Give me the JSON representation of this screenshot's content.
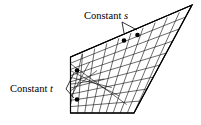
{
  "figure": {
    "type": "geometric-diagram",
    "background_color": "#ffffff",
    "line_color": "#000000",
    "grid_color": "#1a1a1a",
    "labels": [
      {
        "id": "constant-s",
        "prefix": "Constant",
        "symbol": "s",
        "text_x": 84,
        "text_y": 19,
        "leader": "M 122 22 L 124 33 M 122 22 L 137 30",
        "dots": [
          {
            "cx": 124.0,
            "cy": 40.5,
            "r": 2.3
          },
          {
            "cx": 137.5,
            "cy": 35.0,
            "r": 2.3
          }
        ]
      },
      {
        "id": "constant-t",
        "prefix": "Constant",
        "symbol": "t",
        "text_x": 10,
        "text_y": 92,
        "leader": "M 66 89 L 74 73 M 66 89 L 74 98",
        "dots": [
          {
            "cx": 77.0,
            "cy": 70.5,
            "r": 2.3
          },
          {
            "cx": 77.0,
            "cy": 99.5,
            "r": 2.3
          }
        ]
      }
    ],
    "patch": {
      "corners": {
        "top_left": [
          70.5,
          57.0
        ],
        "top_right": [
          192.0,
          5.0
        ],
        "bottom_right": [
          134.0,
          113.0
        ],
        "bottom_left": [
          70.5,
          113.0
        ]
      },
      "outline_path": "M 70.5 57 L 192 5 L 134 113 L 70.5 113 Z",
      "grid_u_divisions": 9,
      "grid_v_divisions": 8
    }
  }
}
